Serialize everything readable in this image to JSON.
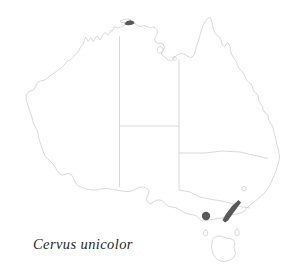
{
  "figure": {
    "kind": "species-distribution-map",
    "region": "Australia",
    "background_color": "#ffffff"
  },
  "caption": {
    "species_name": "Cervus unicolor",
    "style": "italic-serif",
    "color": "#262626"
  },
  "map": {
    "outline_color": "#c8c8c8",
    "border_color": "#c8c8c8",
    "outline_width": 0.7,
    "coastline_name": "australia-coastline",
    "state_borders_name": "australia-state-borders",
    "islands": [
      {
        "name": "tasmania"
      },
      {
        "name": "king-island"
      },
      {
        "name": "flinders-island"
      },
      {
        "name": "melville-island"
      },
      {
        "name": "groote-eylandt"
      },
      {
        "name": "kangaroo-island"
      },
      {
        "name": "fraser-island"
      },
      {
        "name": "dirk-hartog-island"
      }
    ]
  },
  "occurrences": {
    "marker_color": "#585858",
    "points": [
      {
        "name": "occurrence-cobourg-peninsula",
        "type": "patch",
        "x": 130,
        "y": 22
      },
      {
        "name": "occurrence-western-victoria",
        "type": "dot",
        "x": 206,
        "y": 216,
        "radius": 4.2
      },
      {
        "name": "occurrence-eastern-victoria-highlands",
        "type": "streak",
        "x": 232,
        "y": 211
      }
    ]
  }
}
